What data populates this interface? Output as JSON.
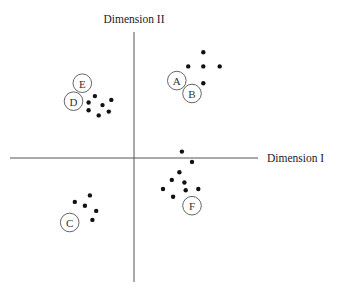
{
  "chart_data": {
    "type": "scatter",
    "title": "",
    "xlabel": "Dimension I",
    "ylabel": "Dimension II",
    "grid": false,
    "axes": "crossing at origin, no ticks",
    "xlim": [
      -10,
      10
    ],
    "ylim": [
      -10,
      10
    ],
    "clusters": [
      {
        "name": "AB",
        "points": [
          [
            5.5,
            8.2
          ],
          [
            4.3,
            7.1
          ],
          [
            5.5,
            7.1
          ],
          [
            6.8,
            7.1
          ],
          [
            5.5,
            5.8
          ]
        ],
        "labels": [
          {
            "text": "A",
            "x": 3.4,
            "y": 6.0
          },
          {
            "text": "B",
            "x": 4.6,
            "y": 5.0
          }
        ]
      },
      {
        "name": "DE",
        "points": [
          [
            -3.1,
            4.8
          ],
          [
            -3.6,
            4.3
          ],
          [
            -1.8,
            4.5
          ],
          [
            -2.5,
            4.1
          ],
          [
            -3.6,
            3.7
          ],
          [
            -2.0,
            3.6
          ],
          [
            -2.8,
            3.3
          ]
        ],
        "labels": [
          {
            "text": "E",
            "x": -4.1,
            "y": 5.8
          },
          {
            "text": "D",
            "x": -4.8,
            "y": 4.4
          }
        ]
      },
      {
        "name": "F",
        "points": [
          [
            3.8,
            0.5
          ],
          [
            4.6,
            -0.3
          ],
          [
            3.6,
            -1.1
          ],
          [
            3.0,
            -1.7
          ],
          [
            4.0,
            -1.9
          ],
          [
            2.3,
            -2.4
          ],
          [
            4.1,
            -2.5
          ],
          [
            5.1,
            -2.4
          ],
          [
            3.1,
            -3.0
          ]
        ],
        "labels": [
          {
            "text": "F",
            "x": 4.6,
            "y": -3.7
          }
        ]
      },
      {
        "name": "C",
        "points": [
          [
            -3.5,
            -2.9
          ],
          [
            -4.7,
            -3.4
          ],
          [
            -3.9,
            -3.7
          ],
          [
            -3.0,
            -4.1
          ],
          [
            -3.3,
            -4.8
          ]
        ],
        "labels": [
          {
            "text": "C",
            "x": -5.1,
            "y": -5.0
          }
        ]
      }
    ]
  }
}
